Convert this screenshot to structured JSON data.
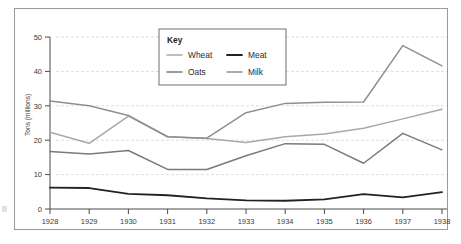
{
  "chart_data": {
    "type": "line",
    "title": "",
    "xlabel": "",
    "ylabel": "Tons (millions)",
    "x": [
      1928,
      1929,
      1930,
      1931,
      1932,
      1933,
      1934,
      1935,
      1936,
      1937,
      1938
    ],
    "xtick_labels": [
      "1928",
      "1929",
      "1930",
      "1931",
      "1932",
      "1933",
      "1934",
      "1935",
      "1936",
      "1937",
      "1938"
    ],
    "ytick_labels": [
      "0",
      "10",
      "20",
      "30",
      "40",
      "50"
    ],
    "yticks": [
      0,
      10,
      20,
      30,
      40,
      50
    ],
    "ylim": [
      0,
      50
    ],
    "grid": true,
    "legend_position": "top-center",
    "legend_title": "Key",
    "series": [
      {
        "name": "Wheat",
        "color": "#a8a8a8",
        "width": 1.5,
        "values": [
          22.3,
          19.1,
          27.0,
          21.0,
          20.5,
          19.3,
          21.0,
          21.8,
          23.5,
          26.2,
          29.0
        ]
      },
      {
        "name": "Oats",
        "color": "#7a7a7a",
        "width": 1.5,
        "values": [
          16.7,
          16.0,
          17.0,
          11.5,
          11.5,
          15.5,
          19.0,
          18.8,
          13.3,
          22.0,
          17.2
        ]
      },
      {
        "name": "Meat",
        "color": "#222222",
        "width": 1.8,
        "values": [
          6.2,
          6.1,
          4.4,
          4.0,
          3.1,
          2.5,
          2.4,
          2.8,
          4.3,
          3.4,
          4.9
        ]
      },
      {
        "name": "Milk",
        "color": "#8f8f8f",
        "width": 1.5,
        "values": [
          31.4,
          30.0,
          27.2,
          21.0,
          20.6,
          28.0,
          30.7,
          31.0,
          31.1,
          47.5,
          41.6
        ]
      }
    ]
  },
  "legend": {
    "title": "Key",
    "entries": [
      {
        "label": "Wheat",
        "color": "#a8a8a8"
      },
      {
        "label": "Meat",
        "color": "#222222"
      },
      {
        "label": "Oats",
        "color": "#7a7a7a"
      },
      {
        "label": "Milk",
        "color": "#8f8f8f"
      }
    ]
  },
  "axes": {
    "y_title": "Tons (millions)"
  },
  "style": {
    "grid_color": "#cfcfd6",
    "axis_color": "#4a4a4a",
    "frame_color": "#9a9a9a",
    "background": "#ffffff"
  }
}
